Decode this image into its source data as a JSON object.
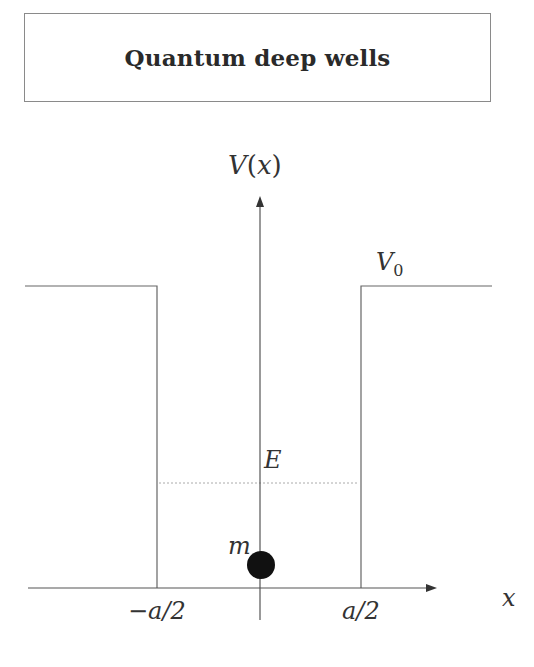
{
  "title": "Quantum deep wells",
  "labels": {
    "y_axis": "V(x)",
    "y_axis_var": "V",
    "y_axis_arg": "x",
    "x_axis": "x",
    "potential_height": "V",
    "potential_height_sub": "0",
    "energy": "E",
    "mass": "m",
    "left_edge": "−a/2",
    "right_edge": "a/2"
  },
  "colors": {
    "line": "#555555",
    "particle": "#111111",
    "dotted": "#999999"
  }
}
